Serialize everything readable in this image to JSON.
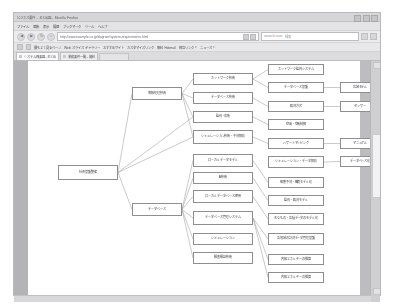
{
  "window": {
    "title": "ビジネス要件 - まとめ図 - Mozilla Firefox",
    "controls": [
      "minimize",
      "maximize",
      "close"
    ]
  },
  "menubar": {
    "items": [
      "ファイル",
      "編集",
      "表示",
      "履歴",
      "ブックマーク",
      "ツール",
      "ヘルプ"
    ]
  },
  "navbar": {
    "back_icon": "◀",
    "forward_icon": "▶",
    "reload_icon": "↻",
    "home_icon": "⌂",
    "url": "http://www.example.co.jp/diagram/system-requirements.html",
    "url_icons": [
      "bookmark-star-icon",
      "rss-icon"
    ],
    "search": {
      "icon": "search-icon",
      "placeholder": "検索",
      "value": "検索"
    },
    "end_icons": [
      "downloads-icon",
      "menu-icon"
    ]
  },
  "bookmarks": {
    "items": [
      {
        "label": "最もよく見るページ"
      },
      {
        "label": "Web スライス ギャラリー"
      },
      {
        "label": "おすすめサイト"
      },
      {
        "label": "カスタマイズ リンク"
      },
      {
        "label": "無料 Hotmail"
      },
      {
        "label": "相互リンク"
      },
      {
        "label": "ニュース"
      },
      {
        "label": "お気に入り"
      }
    ]
  },
  "tabs": [
    {
      "label": "システム概要図 - まとめ",
      "active": true
    },
    {
      "label": "業務要件一覧 - 資料",
      "active": false
    }
  ],
  "newtab_label": "",
  "diagram": {
    "nodes": [
      {
        "id": "root",
        "label": "社会基盤整備",
        "x": 30,
        "y": 104,
        "w": 60,
        "h": 15
      },
      {
        "id": "n-info",
        "label": "情報処理技術",
        "x": 104,
        "y": 26,
        "w": 50,
        "h": 13
      },
      {
        "id": "n-net",
        "label": "ネットワーク技術",
        "x": 165,
        "y": 12,
        "w": 60,
        "h": 12
      },
      {
        "id": "n-sec",
        "label": "データベース技術",
        "x": 165,
        "y": 31,
        "w": 60,
        "h": 12
      },
      {
        "id": "n-mon",
        "label": "監視・収集",
        "x": 165,
        "y": 50,
        "w": 60,
        "h": 12
      },
      {
        "id": "n-sim",
        "label": "シミュレーション技術・予測解析",
        "x": 165,
        "y": 69,
        "w": 60,
        "h": 14
      },
      {
        "id": "n-loc",
        "label": "ローカルデータモデル",
        "x": 165,
        "y": 93,
        "w": 60,
        "h": 13
      },
      {
        "id": "n-ai",
        "label": "AI技術",
        "x": 165,
        "y": 111,
        "w": 60,
        "h": 12
      },
      {
        "id": "n-db2",
        "label": "ローカルデータベース運用",
        "x": 165,
        "y": 129,
        "w": 60,
        "h": 13
      },
      {
        "id": "n-dbm",
        "label": "データベース管理システム",
        "x": 165,
        "y": 150,
        "w": 60,
        "h": 14
      },
      {
        "id": "n-sens",
        "label": "シミュレーション",
        "x": 165,
        "y": 172,
        "w": 60,
        "h": 12
      },
      {
        "id": "n-view",
        "label": "検査検証技術",
        "x": 165,
        "y": 191,
        "w": 60,
        "h": 12
      },
      {
        "id": "n-data",
        "label": "データベース",
        "x": 104,
        "y": 142,
        "w": 50,
        "h": 13
      },
      {
        "id": "r-mon",
        "label": "ネットワーク監視システム",
        "x": 240,
        "y": 3,
        "w": 56,
        "h": 11
      },
      {
        "id": "r-gis",
        "label": "データベース基盤",
        "x": 240,
        "y": 21,
        "w": 56,
        "h": 11
      },
      {
        "id": "r-sens",
        "label": "観測方式",
        "x": 240,
        "y": 40,
        "w": 56,
        "h": 11
      },
      {
        "id": "r-ctrl",
        "label": "空間・空間制御",
        "x": 240,
        "y": 58,
        "w": 56,
        "h": 11
      },
      {
        "id": "r-mode",
        "label": "ハザードマッピング",
        "x": 240,
        "y": 77,
        "w": 56,
        "h": 11
      },
      {
        "id": "r-sim",
        "label": "シミュレーション・データ解析",
        "x": 240,
        "y": 95,
        "w": 56,
        "h": 12
      },
      {
        "id": "r-ml",
        "label": "被害予測・構造モデル化",
        "x": 240,
        "y": 116,
        "w": 56,
        "h": 11
      },
      {
        "id": "r-dbm",
        "label": "監視・観測モデル",
        "x": 240,
        "y": 134,
        "w": 56,
        "h": 11
      },
      {
        "id": "r-g1",
        "label": "主なもの・各種データのモデル化",
        "x": 240,
        "y": 152,
        "w": 56,
        "h": 12
      },
      {
        "id": "r-g2",
        "label": "各地域の計測データ管理基盤",
        "x": 240,
        "y": 172,
        "w": 56,
        "h": 12
      },
      {
        "id": "r-g3",
        "label": "内部エネルギーの推算",
        "x": 240,
        "y": 193,
        "w": 56,
        "h": 11
      },
      {
        "id": "r-g4",
        "label": "内部エネルギーの推算",
        "x": 240,
        "y": 211,
        "w": 56,
        "h": 11
      },
      {
        "id": "f-1",
        "label": "広域モデル",
        "x": 312,
        "y": 21,
        "w": 40,
        "h": 11
      },
      {
        "id": "f-2",
        "label": "センサー",
        "x": 312,
        "y": 40,
        "w": 40,
        "h": 11
      },
      {
        "id": "f-3",
        "label": "マニュアル",
        "x": 312,
        "y": 77,
        "w": 40,
        "h": 11
      },
      {
        "id": "f-4",
        "label": "データベース化",
        "x": 312,
        "y": 95,
        "w": 40,
        "h": 11
      }
    ],
    "edges": [
      [
        "root",
        "n-info"
      ],
      [
        "root",
        "n-data"
      ],
      [
        "root",
        "n-sim"
      ],
      [
        "root",
        "n-mon"
      ],
      [
        "n-info",
        "n-net"
      ],
      [
        "n-info",
        "n-sec"
      ],
      [
        "n-info",
        "n-mon"
      ],
      [
        "n-info",
        "n-sim"
      ],
      [
        "n-data",
        "n-loc"
      ],
      [
        "n-data",
        "n-ai"
      ],
      [
        "n-data",
        "n-db2"
      ],
      [
        "n-data",
        "n-dbm"
      ],
      [
        "n-data",
        "n-sens"
      ],
      [
        "n-data",
        "n-view"
      ],
      [
        "n-net",
        "r-mon"
      ],
      [
        "n-net",
        "r-gis"
      ],
      [
        "n-sec",
        "r-sens"
      ],
      [
        "n-mon",
        "r-ctrl"
      ],
      [
        "n-sim",
        "r-mode"
      ],
      [
        "n-loc",
        "r-ml"
      ],
      [
        "n-ai",
        "r-dbm"
      ],
      [
        "n-db2",
        "r-g1"
      ],
      [
        "n-dbm",
        "r-g2"
      ],
      [
        "n-dbm",
        "r-g3"
      ],
      [
        "n-dbm",
        "r-g4"
      ],
      [
        "r-gis",
        "f-1"
      ],
      [
        "r-sens",
        "f-2"
      ],
      [
        "r-mode",
        "f-3"
      ],
      [
        "r-sim",
        "f-4"
      ]
    ]
  },
  "scrollbar": {
    "up_arrow": "▲",
    "down_arrow": "▼",
    "thumb_position_pct": 40
  }
}
